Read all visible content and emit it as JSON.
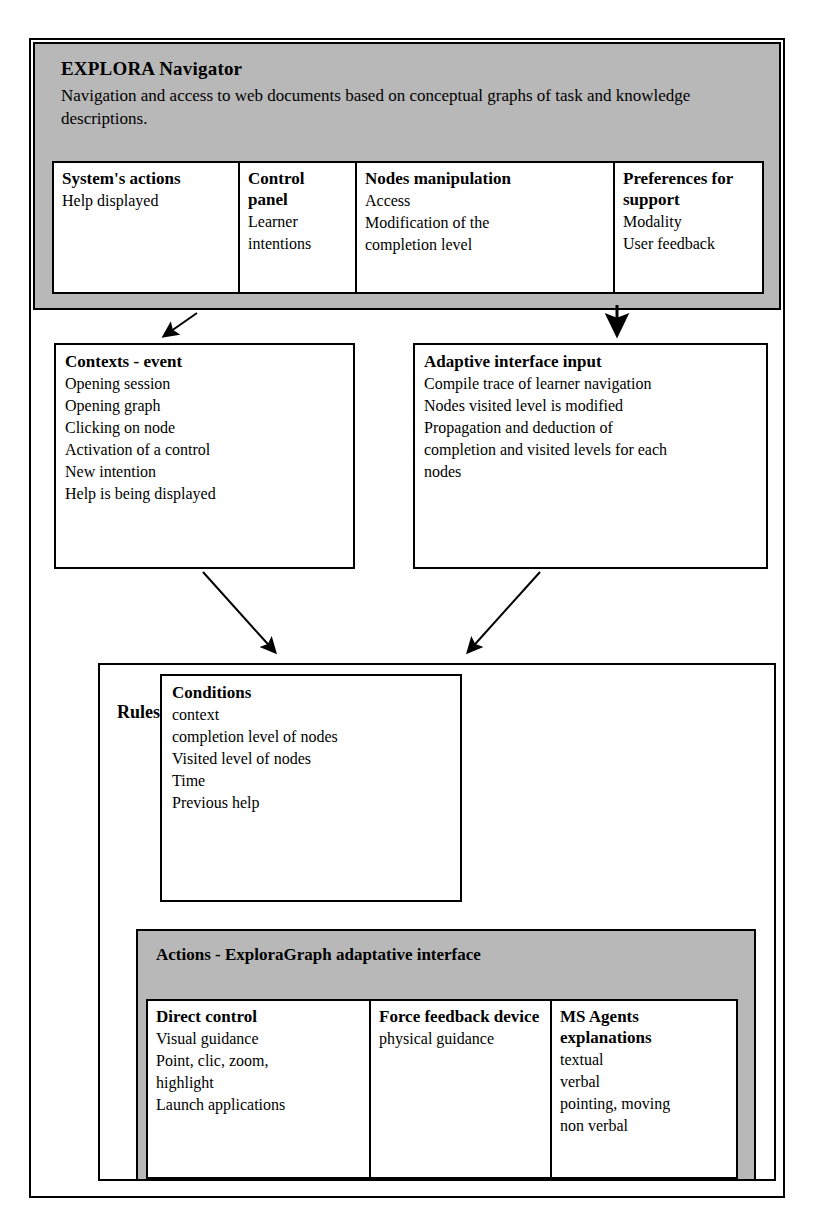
{
  "diagram": {
    "header": {
      "title": "EXPLORA Navigator",
      "subtitle": "Navigation and access to web documents based on conceptual graphs of task and knowledge descriptions.",
      "background_color": "#b8b8b8",
      "columns": [
        {
          "title": "System's actions",
          "lines": [
            "Help displayed"
          ]
        },
        {
          "title": "Control panel",
          "lines": [
            "Learner",
            "intentions"
          ]
        },
        {
          "title": "Nodes manipulation",
          "lines": [
            "Access",
            "Modification of the",
            "completion level"
          ]
        },
        {
          "title": "Preferences for support",
          "lines": [
            "Modality",
            "User feedback"
          ]
        }
      ]
    },
    "middle": {
      "contexts": {
        "title": "Contexts - event",
        "lines": [
          "Opening session",
          "Opening graph",
          "Clicking on node",
          "Activation of a control",
          "New intention",
          "Help is being displayed"
        ]
      },
      "adaptive_input": {
        "title": "Adaptive interface input",
        "lines": [
          "Compile trace of learner navigation",
          "Nodes visited level is modified",
          "Propagation and deduction of",
          "completion and visited levels for each",
          "nodes"
        ]
      }
    },
    "rules": {
      "label": "Rules",
      "conditions": {
        "title": "Conditions",
        "lines": [
          "context",
          "completion level of nodes",
          "Visited level of nodes",
          "Time",
          "Previous help"
        ]
      },
      "actions": {
        "title": "Actions - ExploraGraph adaptative interface",
        "background_color": "#b8b8b8",
        "columns": [
          {
            "title": "Direct control",
            "lines": [
              "Visual guidance",
              "Point, clic, zoom,",
              "highlight",
              "Launch applications"
            ]
          },
          {
            "title": "Force feedback device",
            "lines": [
              "physical guidance"
            ]
          },
          {
            "title": "MS Agents explanations",
            "lines": [
              "textual",
              "verbal",
              "pointing, moving",
              "non verbal"
            ]
          }
        ]
      }
    },
    "connectors": [
      {
        "name": "header-to-contexts",
        "from": "header-panel",
        "to": "contexts-box"
      },
      {
        "name": "header-to-adaptive",
        "from": "header-panel",
        "to": "adaptive-box"
      },
      {
        "name": "contexts-to-rules",
        "from": "contexts-box",
        "to": "rules-panel"
      },
      {
        "name": "adaptive-to-rules",
        "from": "adaptive-box",
        "to": "rules-panel"
      }
    ]
  }
}
